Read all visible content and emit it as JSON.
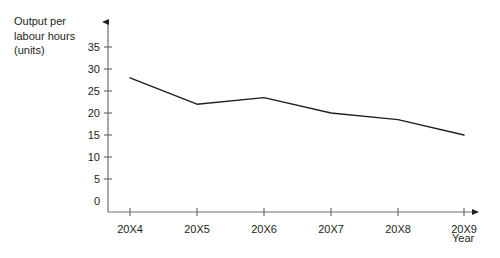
{
  "chart_data": {
    "type": "line",
    "title": "",
    "ylabel": "Output per\nlabour hours\n(units)",
    "xlabel": "Year",
    "categories": [
      "20X4",
      "20X5",
      "20X6",
      "20X7",
      "20X8",
      "20X9"
    ],
    "values": [
      30.5,
      24.5,
      26.0,
      22.5,
      21.0,
      17.5
    ],
    "series": [
      {
        "name": "Output per labour hours (units)",
        "values": [
          30.5,
          24.5,
          26.0,
          22.5,
          21.0,
          17.5
        ]
      }
    ],
    "ylim": [
      0,
      35
    ],
    "ytick_labels": [
      "0",
      "5",
      "10",
      "15",
      "20",
      "25",
      "30",
      "35"
    ],
    "ytick_values": [
      0,
      5,
      10,
      15,
      20,
      25,
      30,
      35
    ],
    "grid": false,
    "legend": "none",
    "axis_arrows": true,
    "line_color": "#231f20",
    "axis_color": "#6d6e71",
    "background_color": "#ffffff"
  },
  "axis_titles": {
    "y": "Output per\nlabour hours\n(units)",
    "x": "Year"
  }
}
